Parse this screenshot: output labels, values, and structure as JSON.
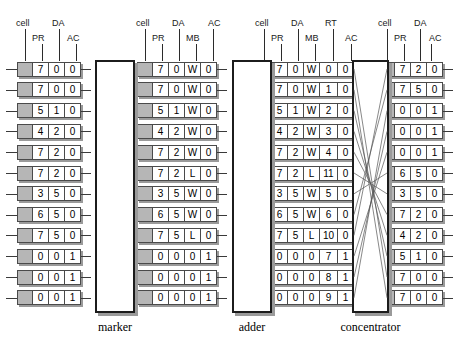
{
  "diagram": {
    "stage_labels": [
      {
        "name": "marker",
        "label": "marker"
      },
      {
        "name": "adder",
        "label": "adder"
      },
      {
        "name": "concentrator",
        "label": "concentrator"
      }
    ],
    "columns": [
      {
        "name": "input-stream",
        "headers_top": [
          "cell",
          "DA"
        ],
        "headers_bottom": [
          "PR",
          "AC"
        ],
        "fields": [
          "cell",
          "PR",
          "DA",
          "AC"
        ],
        "rows": [
          [
            "",
            "7",
            "0",
            "0"
          ],
          [
            "",
            "7",
            "0",
            "0"
          ],
          [
            "",
            "5",
            "1",
            "0"
          ],
          [
            "",
            "4",
            "2",
            "0"
          ],
          [
            "",
            "7",
            "2",
            "0"
          ],
          [
            "",
            "7",
            "2",
            "0"
          ],
          [
            "",
            "3",
            "5",
            "0"
          ],
          [
            "",
            "6",
            "5",
            "0"
          ],
          [
            "",
            "7",
            "5",
            "0"
          ],
          [
            "",
            "0",
            "0",
            "1"
          ],
          [
            "",
            "0",
            "0",
            "1"
          ],
          [
            "",
            "0",
            "0",
            "1"
          ]
        ]
      },
      {
        "name": "after-marker",
        "headers_top": [
          "cell",
          "DA",
          "AC"
        ],
        "headers_bottom": [
          "PR",
          "MB"
        ],
        "fields": [
          "cell",
          "PR",
          "DA",
          "MB",
          "AC"
        ],
        "rows": [
          [
            "",
            "7",
            "0",
            "W",
            "0"
          ],
          [
            "",
            "7",
            "0",
            "W",
            "0"
          ],
          [
            "",
            "5",
            "1",
            "W",
            "0"
          ],
          [
            "",
            "4",
            "2",
            "W",
            "0"
          ],
          [
            "",
            "7",
            "2",
            "W",
            "0"
          ],
          [
            "",
            "7",
            "2",
            "L",
            "0"
          ],
          [
            "",
            "3",
            "5",
            "W",
            "0"
          ],
          [
            "",
            "6",
            "5",
            "W",
            "0"
          ],
          [
            "",
            "7",
            "5",
            "L",
            "0"
          ],
          [
            "",
            "0",
            "0",
            "0",
            "1"
          ],
          [
            "",
            "0",
            "0",
            "0",
            "1"
          ],
          [
            "",
            "0",
            "0",
            "0",
            "1"
          ]
        ]
      },
      {
        "name": "after-adder",
        "headers_top": [
          "cell",
          "DA",
          "RT"
        ],
        "headers_bottom": [
          "PR",
          "MB",
          "AC"
        ],
        "fields": [
          "cell",
          "PR",
          "DA",
          "MB",
          "RT",
          "AC"
        ],
        "rows": [
          [
            "",
            "7",
            "0",
            "W",
            "0",
            "0"
          ],
          [
            "",
            "7",
            "0",
            "W",
            "1",
            "0"
          ],
          [
            "",
            "5",
            "1",
            "W",
            "2",
            "0"
          ],
          [
            "",
            "4",
            "2",
            "W",
            "3",
            "0"
          ],
          [
            "",
            "7",
            "2",
            "W",
            "4",
            "0"
          ],
          [
            "",
            "7",
            "2",
            "L",
            "11",
            "0"
          ],
          [
            "",
            "3",
            "5",
            "W",
            "5",
            "0"
          ],
          [
            "",
            "6",
            "5",
            "W",
            "6",
            "0"
          ],
          [
            "",
            "7",
            "5",
            "L",
            "10",
            "0"
          ],
          [
            "",
            "0",
            "0",
            "0",
            "7",
            "1"
          ],
          [
            "",
            "0",
            "0",
            "0",
            "8",
            "1"
          ],
          [
            "",
            "0",
            "0",
            "0",
            "9",
            "1"
          ]
        ]
      },
      {
        "name": "after-concentrator",
        "headers_top": [
          "cell",
          "DA"
        ],
        "headers_bottom": [
          "PR",
          "AC"
        ],
        "fields": [
          "cell",
          "PR",
          "DA",
          "AC"
        ],
        "rows": [
          [
            "",
            "7",
            "2",
            "0"
          ],
          [
            "",
            "7",
            "5",
            "0"
          ],
          [
            "",
            "0",
            "0",
            "1"
          ],
          [
            "",
            "0",
            "0",
            "1"
          ],
          [
            "",
            "0",
            "0",
            "1"
          ],
          [
            "",
            "6",
            "5",
            "0"
          ],
          [
            "",
            "3",
            "5",
            "0"
          ],
          [
            "",
            "7",
            "2",
            "0"
          ],
          [
            "",
            "4",
            "2",
            "0"
          ],
          [
            "",
            "5",
            "1",
            "0"
          ],
          [
            "",
            "7",
            "0",
            "0"
          ],
          [
            "",
            "7",
            "0",
            "0"
          ]
        ]
      }
    ]
  },
  "colors": {
    "cell_gray": "#b6b6b6",
    "border": "#4a4a4a",
    "box_border": "#1c1c1c",
    "line": "#3a3a3a",
    "shadow": "#9a9a9a"
  }
}
